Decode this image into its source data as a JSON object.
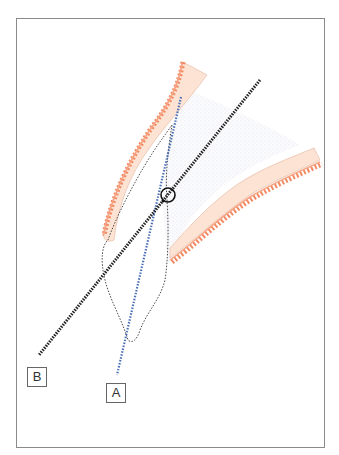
{
  "figure": {
    "type": "anatomical-diagram",
    "labels": {
      "a": "A",
      "b": "B"
    },
    "colors": {
      "gingiva_outer": "#f28a63",
      "gingiva_inner": "#fde3d3",
      "line_a": "#4a6fb5",
      "line_b": "#222222",
      "tooth_outline": "#333333",
      "bone_stipple": "#e6e9ee",
      "frame": "#8a8a8a"
    },
    "elements": [
      "upper-gingiva-band",
      "lower-gingiva-band",
      "tooth-outline",
      "axis-line-a",
      "axis-line-b",
      "center-of-rotation-marker"
    ]
  }
}
